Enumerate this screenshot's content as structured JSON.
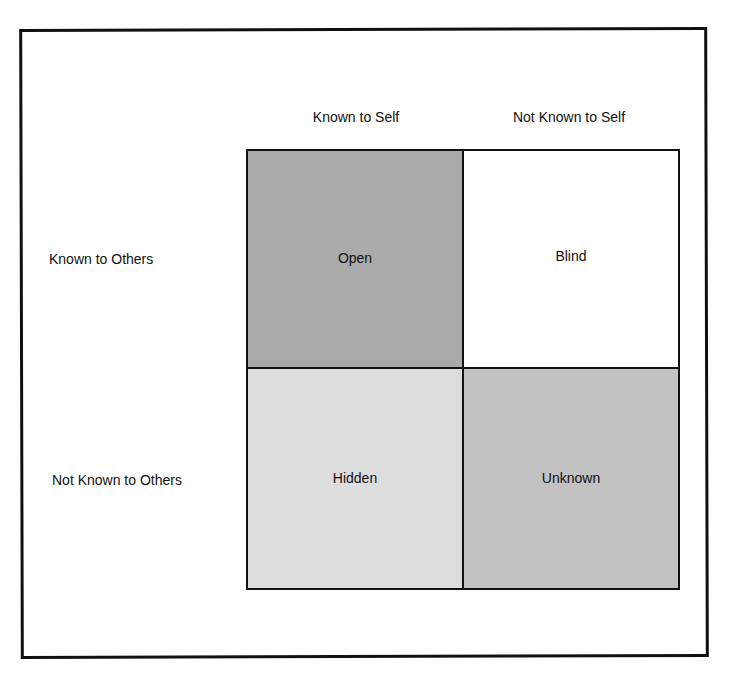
{
  "diagram": {
    "columns": [
      {
        "label": "Known to Self"
      },
      {
        "label": "Not Known to Self"
      }
    ],
    "rows": [
      {
        "label": "Known to Others"
      },
      {
        "label": "Not Known to Others"
      }
    ],
    "cells": [
      {
        "label": "Open",
        "fill": "#aaaaaa"
      },
      {
        "label": "Blind",
        "fill": "#ffffff"
      },
      {
        "label": "Hidden",
        "fill": "#dddddd"
      },
      {
        "label": "Unknown",
        "fill": "#c2c2c2"
      }
    ]
  }
}
